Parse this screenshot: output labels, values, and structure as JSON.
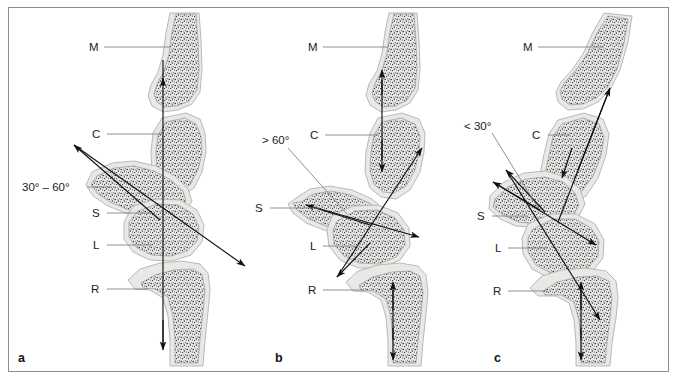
{
  "figure": {
    "panel_count": 3,
    "colors": {
      "bone_fill": "#e8e8e6",
      "bone_outline": "#b9b9b5",
      "axis": "#111111",
      "leader": "#7d7d7d",
      "frame": "#8d8d8d",
      "background": "#ffffff",
      "trabecular": "#1c1c1c"
    }
  },
  "panels": [
    {
      "id": "a",
      "letter": "a",
      "angle_label": "30° – 60°",
      "description": "Normal scapholunate angle",
      "labels": [
        {
          "key": "M",
          "text": "M",
          "meaning": "metacarpal"
        },
        {
          "key": "C",
          "text": "C",
          "meaning": "capitate"
        },
        {
          "key": "S",
          "text": "S",
          "meaning": "scaphoid"
        },
        {
          "key": "L",
          "text": "L",
          "meaning": "lunate"
        },
        {
          "key": "R",
          "text": "R",
          "meaning": "radius"
        }
      ]
    },
    {
      "id": "b",
      "letter": "b",
      "angle_label": "> 60°",
      "description": "Dorsal intercalated segment instability (DISI)",
      "labels": [
        {
          "key": "M",
          "text": "M",
          "meaning": "metacarpal"
        },
        {
          "key": "C",
          "text": "C",
          "meaning": "capitate"
        },
        {
          "key": "S",
          "text": "S",
          "meaning": "scaphoid"
        },
        {
          "key": "L",
          "text": "L",
          "meaning": "lunate"
        },
        {
          "key": "R",
          "text": "R",
          "meaning": "radius"
        }
      ]
    },
    {
      "id": "c",
      "letter": "c",
      "angle_label": "< 30°",
      "description": "Volar intercalated segment instability (VISI)",
      "labels": [
        {
          "key": "M",
          "text": "M",
          "meaning": "metacarpal"
        },
        {
          "key": "C",
          "text": "C",
          "meaning": "capitate"
        },
        {
          "key": "S",
          "text": "S",
          "meaning": "scaphoid"
        },
        {
          "key": "L",
          "text": "L",
          "meaning": "lunate"
        },
        {
          "key": "R",
          "text": "R",
          "meaning": "radius"
        }
      ]
    }
  ]
}
